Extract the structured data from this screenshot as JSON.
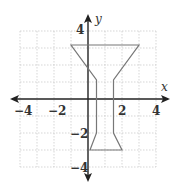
{
  "graph": {
    "x_axis_label": "x",
    "y_axis_label": "y",
    "x_ticks": [
      {
        "value": -4,
        "label": "−4"
      },
      {
        "value": -2,
        "label": "−2"
      },
      {
        "value": 2,
        "label": "2"
      },
      {
        "value": 4,
        "label": "4"
      }
    ],
    "y_ticks": [
      {
        "value": 4,
        "label": "4"
      },
      {
        "value": -2,
        "label": "−2"
      },
      {
        "value": -4,
        "label": "−4"
      }
    ],
    "range": {
      "xmin": -4,
      "xmax": 4,
      "ymin": -4,
      "ymax": 4
    },
    "grid": true,
    "shape_vertices": [
      [
        -1,
        3
      ],
      [
        3,
        3
      ],
      [
        1.5,
        1
      ],
      [
        1.5,
        -2
      ],
      [
        2,
        -3
      ],
      [
        0,
        -3
      ],
      [
        0.5,
        -2
      ],
      [
        0.5,
        1
      ]
    ],
    "colors": {
      "axis": "#222222",
      "grid": "#bbbbbb",
      "shape": "#666666"
    }
  }
}
